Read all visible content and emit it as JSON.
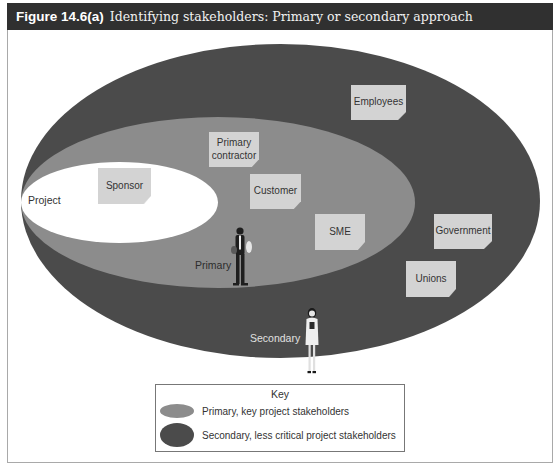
{
  "figure": {
    "number": "Figure 14.6(a)",
    "caption": "Identifying stakeholders: Primary or secondary approach"
  },
  "colors": {
    "title_bar": "#303030",
    "secondary_ellipse": "#4b4b4b",
    "primary_ellipse": "#8c8c8c",
    "project_ellipse": "#ffffff",
    "note": "#d3d3d3"
  },
  "diagram": {
    "zones": {
      "project": "Project",
      "primary": "Primary",
      "secondary": "Secondary"
    },
    "stakeholders": [
      {
        "label": "Sponsor",
        "zone": "project"
      },
      {
        "label": "Primary contractor",
        "zone": "primary"
      },
      {
        "label": "Customer",
        "zone": "primary"
      },
      {
        "label": "SME",
        "zone": "primary"
      },
      {
        "label": "Employees",
        "zone": "secondary"
      },
      {
        "label": "Government",
        "zone": "secondary"
      },
      {
        "label": "Unions",
        "zone": "secondary"
      }
    ]
  },
  "legend": {
    "title": "Key",
    "items": [
      {
        "label": "Primary, key project stakeholders",
        "color": "#8c8c8c"
      },
      {
        "label": "Secondary, less critical project stakeholders",
        "color": "#4b4b4b"
      }
    ]
  }
}
